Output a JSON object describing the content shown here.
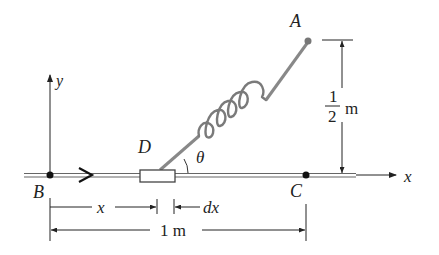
{
  "diagram": {
    "points": {
      "A": "A",
      "B": "B",
      "C": "C",
      "D": "D"
    },
    "axes": {
      "x": "x",
      "y": "y"
    },
    "angle": "θ",
    "dimensions": {
      "height_num": "1",
      "height_den": "2",
      "height_unit": "m",
      "x_label": "x",
      "dx_label": "dx",
      "length": "1 m"
    },
    "colors": {
      "line": "#222222",
      "rod": "#888888",
      "spring": "#7a7a7a"
    }
  }
}
